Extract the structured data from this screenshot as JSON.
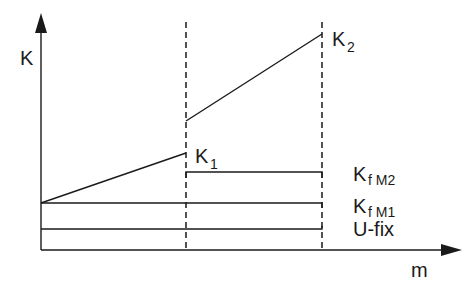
{
  "diagram": {
    "axes": {
      "y_label": "K",
      "x_label": "m"
    },
    "curves": [
      {
        "name": "K",
        "sub": "1",
        "description": "rising line from origin level to first boundary"
      },
      {
        "name": "K",
        "sub": "2",
        "description": "rising line between the two boundaries"
      }
    ],
    "levels": [
      {
        "name": "K",
        "sub": "f M2"
      },
      {
        "name": "K",
        "sub": "f M1"
      },
      {
        "name": "U-fix",
        "sub": ""
      }
    ],
    "boundaries": [
      "boundary-1",
      "boundary-2"
    ]
  }
}
